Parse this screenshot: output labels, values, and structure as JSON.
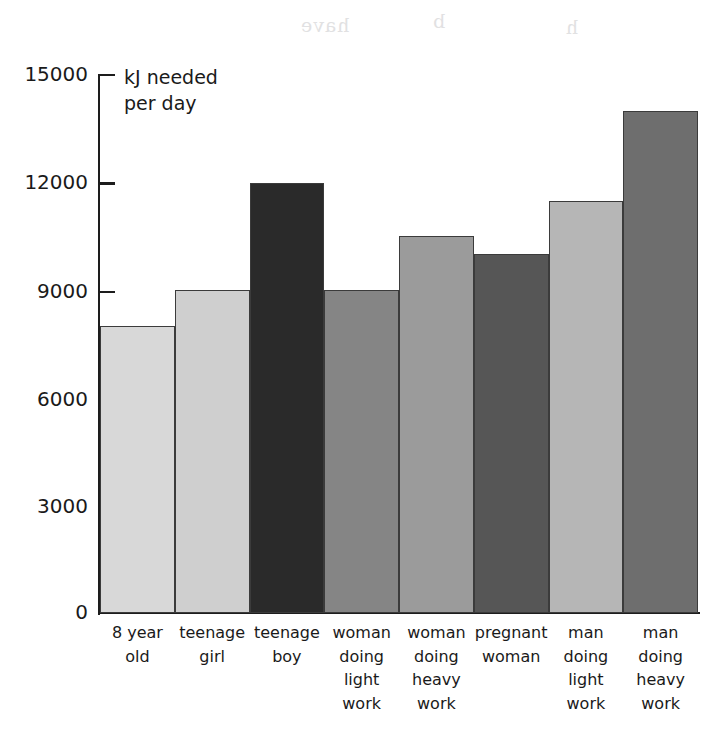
{
  "chart_data": {
    "type": "bar",
    "title": "",
    "subtitle": "",
    "ylabel": "kJ needed\nper day",
    "xlabel": "",
    "ylim": [
      0,
      15000
    ],
    "yticks": [
      0,
      3000,
      6000,
      9000,
      12000,
      15000
    ],
    "ytick_labels": [
      "0",
      "3000",
      "6000",
      "9000",
      "12000",
      "15000"
    ],
    "grid": false,
    "legend": "none",
    "categories": [
      "8 year\nold",
      "teenage\ngirl",
      "teenage\nboy",
      "woman\ndoing\nlight\nwork",
      "woman\ndoing\nheavy\nwork",
      "pregnant\nwoman",
      "man\ndoing\nlight\nwork",
      "man\ndoing\nheavy\nwork"
    ],
    "values": [
      8000,
      9000,
      12000,
      9000,
      10500,
      10000,
      11500,
      14000
    ],
    "bar_colors": [
      "#d8d8d8",
      "#cfcfcf",
      "#2a2a2a",
      "#858585",
      "#9b9b9b",
      "#565656",
      "#b6b6b6",
      "#6e6e6e"
    ],
    "bar_border_color": "#3b3b3b",
    "axis_color": "#1d1d1d",
    "text_color": "#1a1a1a",
    "background": "#ffffff"
  },
  "artifacts": [
    {
      "text": "have",
      "left": 300,
      "top": 14
    },
    {
      "text": "b",
      "left": 430,
      "top": 10
    },
    {
      "text": "h",
      "left": 560,
      "top": 16
    }
  ]
}
